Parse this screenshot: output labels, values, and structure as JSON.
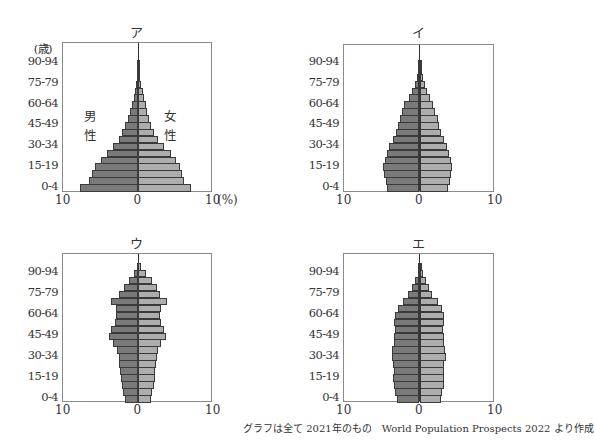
{
  "footer": "グラフは全て 2021年のもの　World Population Prospects 2022 より作成",
  "colors": {
    "male": "#7a7a7a",
    "female": "#adadad",
    "outline": "#3a3a3a",
    "frame": "#8a8a8a"
  },
  "chart_data": [
    {
      "type": "bar",
      "subtype": "population-pyramid",
      "title": "ア",
      "ylabel": "(歳)",
      "xlabel_unit": "(%)",
      "x_ticks": [
        "10",
        "0",
        "10"
      ],
      "y_ticks": [
        "0-4",
        "15-19",
        "30-34",
        "45-49",
        "60-64",
        "75-79",
        "90-94"
      ],
      "legend": [
        "男性",
        "女性"
      ],
      "xlim": [
        -10,
        10
      ],
      "categories": [
        "0-4",
        "5-9",
        "10-14",
        "15-19",
        "20-24",
        "25-29",
        "30-34",
        "35-39",
        "40-44",
        "45-49",
        "50-54",
        "55-59",
        "60-64",
        "65-69",
        "70-74",
        "75-79",
        "80-84",
        "85-89",
        "90-94",
        "95+"
      ],
      "series": [
        {
          "name": "男性",
          "values": [
            7.7,
            6.6,
            6.2,
            5.7,
            5.0,
            4.2,
            3.4,
            2.6,
            2.1,
            1.7,
            1.4,
            1.1,
            0.8,
            0.6,
            0.4,
            0.3,
            0.2,
            0.1,
            0.05,
            0.0
          ]
        },
        {
          "name": "女性",
          "values": [
            7.0,
            6.1,
            5.9,
            5.6,
            5.1,
            4.4,
            3.5,
            2.6,
            2.1,
            1.7,
            1.5,
            1.2,
            1.0,
            0.8,
            0.6,
            0.4,
            0.3,
            0.1,
            0.05,
            0.0
          ]
        }
      ]
    },
    {
      "type": "bar",
      "subtype": "population-pyramid",
      "title": "イ",
      "x_ticks": [
        "10",
        "0",
        "10"
      ],
      "y_ticks": [
        "0-4",
        "15-19",
        "30-34",
        "45-49",
        "60-64",
        "75-79",
        "90-94"
      ],
      "xlim": [
        -10,
        10
      ],
      "categories": [
        "0-4",
        "5-9",
        "10-14",
        "15-19",
        "20-24",
        "25-29",
        "30-34",
        "35-39",
        "40-44",
        "45-49",
        "50-54",
        "55-59",
        "60-64",
        "65-69",
        "70-74",
        "75-79",
        "80-84",
        "85-89",
        "90-94",
        "95+"
      ],
      "series": [
        {
          "name": "男性",
          "values": [
            4.3,
            4.5,
            4.7,
            4.8,
            4.6,
            4.3,
            4.0,
            3.5,
            3.1,
            2.8,
            2.6,
            2.3,
            2.0,
            1.4,
            1.0,
            0.6,
            0.3,
            0.2,
            0.1,
            0.0
          ]
        },
        {
          "name": "女性",
          "values": [
            3.8,
            4.1,
            4.2,
            4.3,
            4.2,
            3.9,
            3.6,
            3.3,
            2.9,
            2.6,
            2.4,
            2.1,
            1.8,
            1.4,
            1.0,
            0.7,
            0.4,
            0.2,
            0.1,
            0.0
          ]
        }
      ]
    },
    {
      "type": "bar",
      "subtype": "population-pyramid",
      "title": "ウ",
      "x_ticks": [
        "10",
        "0",
        "10"
      ],
      "y_ticks": [
        "0-4",
        "15-19",
        "30-34",
        "45-49",
        "60-64",
        "75-79",
        "90-94"
      ],
      "xlim": [
        -10,
        10
      ],
      "categories": [
        "0-4",
        "5-9",
        "10-14",
        "15-19",
        "20-24",
        "25-29",
        "30-34",
        "35-39",
        "40-44",
        "45-49",
        "50-54",
        "55-59",
        "60-64",
        "65-69",
        "70-74",
        "75-79",
        "80-84",
        "85-89",
        "90-94",
        "95+"
      ],
      "series": [
        {
          "name": "男性",
          "values": [
            1.8,
            2.0,
            2.2,
            2.3,
            2.4,
            2.5,
            2.6,
            2.8,
            3.3,
            3.9,
            3.6,
            3.1,
            3.0,
            3.0,
            3.6,
            2.5,
            1.9,
            1.2,
            0.6,
            0.2
          ]
        },
        {
          "name": "女性",
          "values": [
            1.7,
            1.9,
            2.1,
            2.2,
            2.3,
            2.4,
            2.5,
            2.7,
            3.1,
            3.7,
            3.4,
            3.0,
            2.9,
            3.0,
            3.9,
            2.9,
            2.5,
            1.9,
            1.1,
            0.4
          ]
        }
      ]
    },
    {
      "type": "bar",
      "subtype": "population-pyramid",
      "title": "エ",
      "x_ticks": [
        "10",
        "0",
        "10"
      ],
      "y_ticks": [
        "0-4",
        "15-19",
        "30-34",
        "45-49",
        "60-64",
        "75-79",
        "90-94"
      ],
      "xlim": [
        -10,
        10
      ],
      "categories": [
        "0-4",
        "5-9",
        "10-14",
        "15-19",
        "20-24",
        "25-29",
        "30-34",
        "35-39",
        "40-44",
        "45-49",
        "50-54",
        "55-59",
        "60-64",
        "65-69",
        "70-74",
        "75-79",
        "80-84",
        "85-89",
        "90-94",
        "95+"
      ],
      "series": [
        {
          "name": "男性",
          "values": [
            3.0,
            3.2,
            3.4,
            3.5,
            3.4,
            3.5,
            3.7,
            3.6,
            3.4,
            3.4,
            3.3,
            3.4,
            3.3,
            2.9,
            2.2,
            1.5,
            1.0,
            0.6,
            0.2,
            0.05
          ]
        },
        {
          "name": "女性",
          "values": [
            2.8,
            3.0,
            3.2,
            3.2,
            3.2,
            3.3,
            3.5,
            3.4,
            3.2,
            3.2,
            3.1,
            3.2,
            3.3,
            3.0,
            2.4,
            1.7,
            1.2,
            0.8,
            0.4,
            0.1
          ]
        }
      ]
    }
  ]
}
